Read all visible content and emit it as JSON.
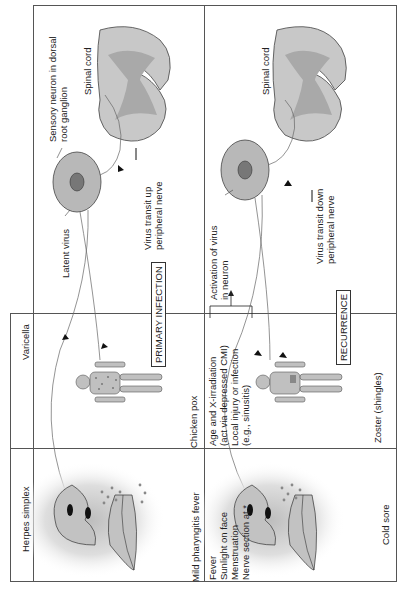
{
  "diagram": {
    "orientation": "rotated 90° counter-clockwise",
    "row_labels": {
      "varicella": "Varicella",
      "herpes_simplex": "Herpes simplex"
    },
    "stages": {
      "primary": "PRIMARY INFECTION",
      "recurrence": "RECURRENCE"
    },
    "primary_panel": {
      "sensory_neuron": "Sensory neuron in dorsal root ganglion",
      "sensory_neuron_line1": "Sensory neuron in dorsal",
      "sensory_neuron_line2": "root ganglion",
      "spinal_cord": "Spinal cord",
      "latent_virus": "Latent virus",
      "transit_up_line1": "Virus transit up",
      "transit_up_line2": "peripheral nerve",
      "chicken_pox": "Chicken pox",
      "mild_pharyngitis": "Mild pharyngitis fever"
    },
    "recurrence_panel": {
      "spinal_cord": "Spinal cord",
      "activation_line1": "Activation of virus",
      "activation_line2": "in neuron",
      "transit_down_line1": "Virus transit down",
      "transit_down_line2": "peripheral nerve",
      "zoster": "Zoster (shingles)",
      "cold_sore": "Cold sore",
      "varicella_triggers": [
        "Age and X-irradiation",
        "(act via depressed CMI)",
        "Local injury or infection",
        "(e.g., sinusitis)"
      ],
      "herpes_triggers": [
        "Fever",
        "Sunlight on face",
        "Menstruation",
        "Nerve section at *"
      ]
    },
    "colors": {
      "border": "#555555",
      "tissue_fill": "#c8c8c8",
      "grey_matter": "#a9a9a9",
      "neuron_fill": "#b5b5b5",
      "nucleus": "#777777",
      "lesion_dots": "#888888"
    }
  }
}
